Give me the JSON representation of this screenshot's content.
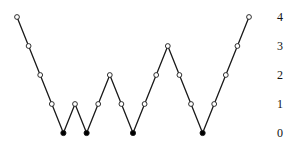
{
  "diagram": {
    "type": "lattice-path",
    "colors": {
      "line": "#1a1a1a",
      "open_fill": "#ffffff",
      "filled": "#000000",
      "label": "#111111"
    },
    "levels": [
      {
        "value": 0,
        "label": "0"
      },
      {
        "value": 1,
        "label": "1"
      },
      {
        "value": 2,
        "label": "2"
      },
      {
        "value": 3,
        "label": "3"
      },
      {
        "value": 4,
        "label": "4"
      }
    ],
    "heights": [
      4,
      3,
      2,
      1,
      0,
      1,
      0,
      1,
      2,
      1,
      0,
      1,
      2,
      3,
      2,
      1,
      0,
      1,
      2,
      3,
      4
    ],
    "filled_at_zero": true
  }
}
